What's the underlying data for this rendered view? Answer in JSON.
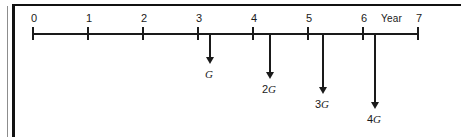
{
  "figure": {
    "type": "cash-flow-timeline",
    "axis_title": "Year",
    "axis": {
      "start_value": 0,
      "end_value": 7,
      "tick_labels": [
        "0",
        "1",
        "2",
        "3",
        "4",
        "5",
        "6",
        "7"
      ],
      "tick_x": [
        33,
        88,
        143,
        198,
        253,
        308,
        363,
        418
      ],
      "line_x_start": 33,
      "line_x_end": 418,
      "line_y": 33
    },
    "cash_flows": [
      {
        "id": "cf-1",
        "year": 4,
        "label": "G",
        "coefficient": "",
        "symbol": "G",
        "direction": "down",
        "x": 209,
        "length": 30,
        "label_y": 68
      },
      {
        "id": "cf-2",
        "year": 5,
        "label": "2G",
        "coefficient": "2",
        "symbol": "G",
        "direction": "down",
        "x": 269,
        "length": 45,
        "label_y": 83
      },
      {
        "id": "cf-3",
        "year": 6,
        "label": "3G",
        "coefficient": "3",
        "symbol": "G",
        "direction": "down",
        "x": 322,
        "length": 60,
        "label_y": 98
      },
      {
        "id": "cf-4",
        "year": 7,
        "label": "4G",
        "coefficient": "4",
        "symbol": "G",
        "direction": "down",
        "x": 374,
        "length": 75,
        "label_y": 113
      }
    ],
    "colors": {
      "ink": "#1a1a1a",
      "frame_rule": "#111111",
      "frame_hairline": "#8d8d8d",
      "background": "#ffffff"
    }
  }
}
